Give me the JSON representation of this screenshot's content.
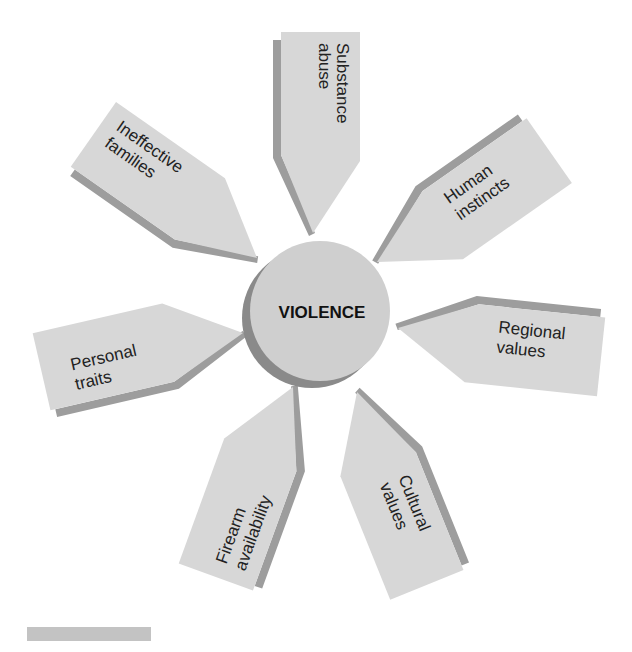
{
  "diagram": {
    "center": {
      "label": "VIOLENCE"
    },
    "factors": [
      {
        "id": "substance-abuse",
        "lines": [
          "Substance",
          "abuse"
        ]
      },
      {
        "id": "human-instincts",
        "lines": [
          "Human",
          "instincts"
        ]
      },
      {
        "id": "regional-values",
        "lines": [
          "Regional",
          "values"
        ]
      },
      {
        "id": "cultural-values",
        "lines": [
          "Cultural",
          "values"
        ]
      },
      {
        "id": "firearm-availability",
        "lines": [
          "Firearm",
          "availability"
        ]
      },
      {
        "id": "personal-traits",
        "lines": [
          "Personal",
          "traits"
        ]
      },
      {
        "id": "ineffective-families",
        "lines": [
          "Ineffective",
          "families"
        ]
      }
    ]
  },
  "colors": {
    "arrow_face": "#d7d7d7",
    "arrow_shadow": "#9d9d9d",
    "circle_face": "#cfcfcf",
    "circle_shadow": "#8a8a8a",
    "footer_bar": "#c3c3c3"
  }
}
